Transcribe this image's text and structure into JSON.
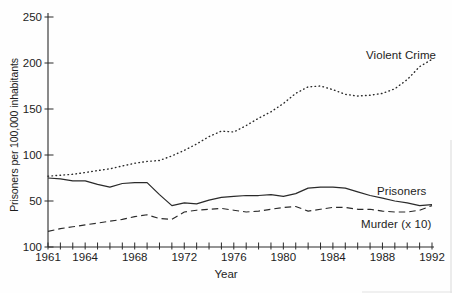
{
  "figure": {
    "background": "#fefefe",
    "ink_color": "#2a2a2a",
    "text_color": "#1d1d1d"
  },
  "labels": {
    "ylabel": "Prisoners per 100,000 inhabitants",
    "xlabel": "Year",
    "violent_crime": "Violent Crime",
    "prisoners": "Prisoners",
    "murder": "Murder (x 10)"
  },
  "chart_data": {
    "type": "line",
    "title": "",
    "xlabel": "Year",
    "ylabel": "Prisoners per 100,000 inhabitants",
    "grid": false,
    "legend": "inline-labels",
    "x_range": [
      1961,
      1992
    ],
    "x_minor_tick_step": 1,
    "x_tick_labels": [
      "1961",
      "1964",
      "1968",
      "1972",
      "1976",
      "1980",
      "1984",
      "1988",
      "1992"
    ],
    "x_tick_label_years": [
      1961,
      1964,
      1968,
      1972,
      1976,
      1980,
      1984,
      1988,
      1992
    ],
    "y_axis": {
      "range": [
        0,
        250
      ],
      "tick_values": [
        0,
        50,
        100,
        150,
        200,
        250
      ],
      "tick_labels_as_printed": [
        "100",
        "50",
        "100",
        "150",
        "200",
        "250"
      ]
    },
    "x": [
      1961,
      1962,
      1963,
      1964,
      1965,
      1966,
      1967,
      1968,
      1969,
      1970,
      1971,
      1972,
      1973,
      1974,
      1975,
      1976,
      1977,
      1978,
      1979,
      1980,
      1981,
      1982,
      1983,
      1984,
      1985,
      1986,
      1987,
      1988,
      1989,
      1990,
      1991,
      1992
    ],
    "series": [
      {
        "name": "Violent Crime",
        "style": "dotted",
        "values": [
          77,
          78,
          79,
          81,
          83,
          85,
          88,
          91,
          93,
          94,
          99,
          105,
          112,
          120,
          126,
          125,
          132,
          140,
          147,
          156,
          167,
          174,
          175,
          171,
          166,
          164,
          165,
          167,
          172,
          182,
          196,
          204
        ]
      },
      {
        "name": "Prisoners",
        "style": "solid",
        "values": [
          75,
          74,
          72,
          72,
          68,
          65,
          69,
          70,
          70,
          57,
          45,
          48,
          47,
          51,
          54,
          55,
          56,
          56,
          57,
          55,
          58,
          64,
          65,
          65,
          64,
          60,
          56,
          53,
          50,
          48,
          45,
          46
        ]
      },
      {
        "name": "Murder (x 10)",
        "style": "dashed",
        "values": [
          17,
          20,
          22,
          24,
          26,
          28,
          30,
          33,
          35,
          31,
          30,
          38,
          40,
          41,
          42,
          40,
          38,
          39,
          41,
          43,
          44,
          39,
          41,
          43,
          43,
          41,
          41,
          39,
          38,
          38,
          40,
          45
        ]
      }
    ]
  }
}
